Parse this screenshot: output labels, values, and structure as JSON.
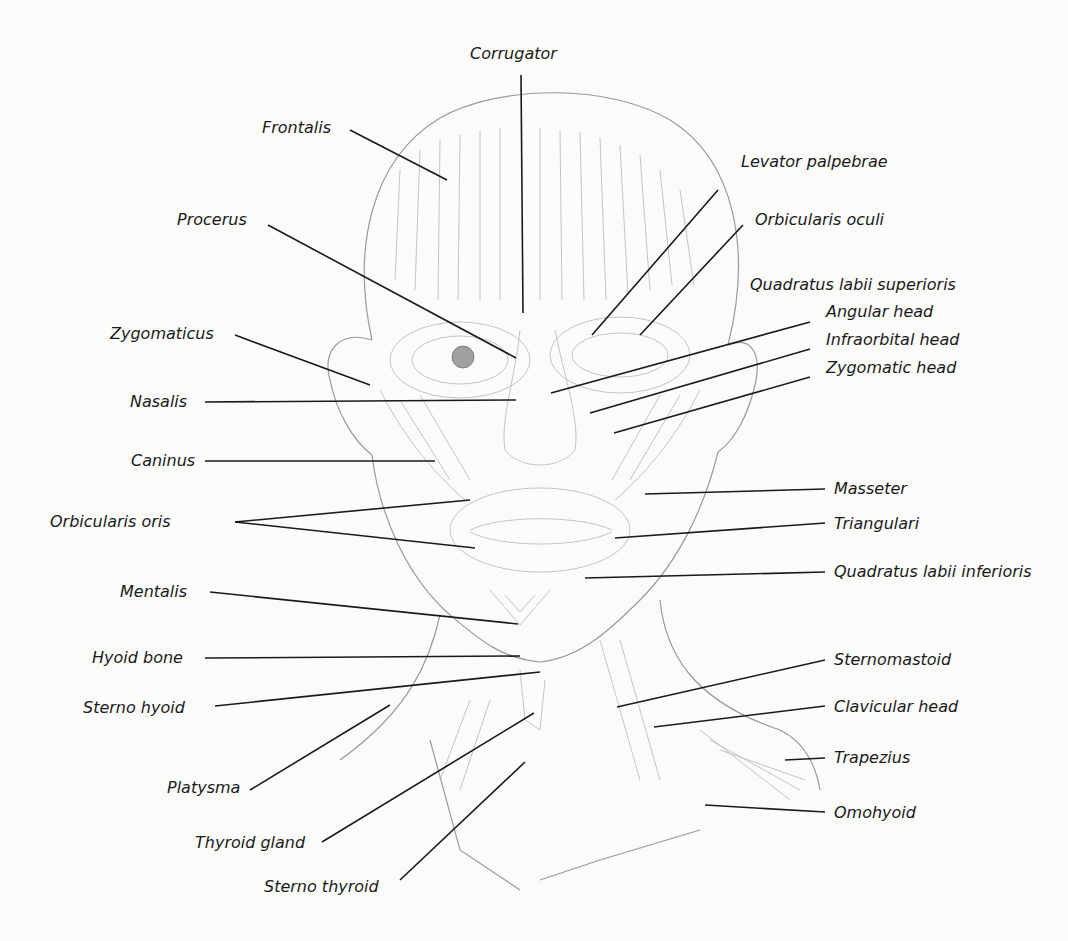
{
  "diagram": {
    "type": "anatomical-illustration",
    "colors": {
      "background": "#fbfbfa",
      "ink": "#1a1a1a",
      "sketch": "#8a8a8a"
    },
    "labels": {
      "corrugator": "Corrugator",
      "frontalis": "Frontalis",
      "levator_palpebrae": "Levator palpebrae",
      "procerus": "Procerus",
      "orbicularis_oculi": "Orbicularis oculi",
      "quadratus_labii_superioris": "Quadratus labii superioris",
      "angular_head": "Angular head",
      "infraorbital_head": "Infraorbital head",
      "zygomatic_head": "Zygomatic head",
      "zygomaticus": "Zygomaticus",
      "nasalis": "Nasalis",
      "caninus": "Caninus",
      "masseter": "Masseter",
      "orbicularis_oris": "Orbicularis oris",
      "triangulari": "Triangulari",
      "quadratus_labii_inferioris": "Quadratus labii inferioris",
      "mentalis": "Mentalis",
      "hyoid_bone": "Hyoid bone",
      "sternomastoid": "Sternomastoid",
      "sterno_hyoid": "Sterno hyoid",
      "clavicular_head": "Clavicular head",
      "trapezius": "Trapezius",
      "platysma": "Platysma",
      "omohyoid": "Omohyoid",
      "thyroid_gland": "Thyroid gland",
      "sterno_thyroid": "Sterno thyroid"
    }
  }
}
